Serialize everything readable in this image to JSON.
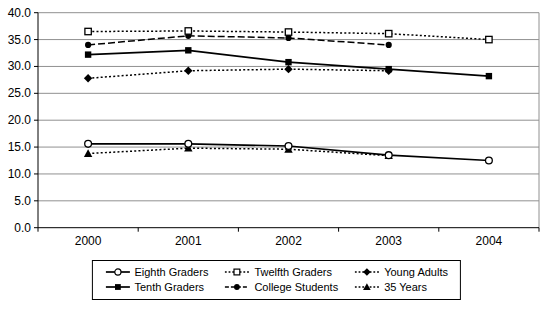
{
  "chart_data": {
    "type": "line",
    "title": "",
    "xlabel": "",
    "ylabel": "",
    "x_labels": [
      "2000",
      "2001",
      "2002",
      "2003",
      "2004"
    ],
    "ylim": [
      0,
      40
    ],
    "y_tick_step": 5,
    "y_tick_labels": [
      "0.0",
      "5.0",
      "10.0",
      "15.0",
      "20.0",
      "25.0",
      "30.0",
      "35.0",
      "40.0"
    ],
    "grid": true,
    "legend_position": "bottom",
    "series": [
      {
        "name": "Young Adults",
        "values": [
          27.8,
          29.2,
          29.5,
          29.2,
          null
        ],
        "line": "dotted",
        "marker": "filled-diamond"
      },
      {
        "name": "College Students",
        "values": [
          34.0,
          35.7,
          35.3,
          34.0,
          null
        ],
        "line": "dashed",
        "marker": "filled-circle"
      },
      {
        "name": "Twelfth Graders",
        "values": [
          36.5,
          36.6,
          36.4,
          36.1,
          35.0
        ],
        "line": "dotted",
        "marker": "open-square"
      },
      {
        "name": "Tenth Graders",
        "values": [
          32.2,
          33.0,
          30.8,
          29.5,
          28.2
        ],
        "line": "solid",
        "marker": "filled-square"
      },
      {
        "name": "35 Years",
        "values": [
          13.8,
          14.8,
          14.6,
          13.4,
          null
        ],
        "line": "dotted",
        "marker": "filled-triangle"
      },
      {
        "name": "Eighth Graders",
        "values": [
          15.6,
          15.6,
          15.2,
          13.5,
          12.5
        ],
        "line": "solid",
        "marker": "open-circle"
      }
    ],
    "legend_order": [
      "Eighth Graders",
      "Twelfth Graders",
      "Young Adults",
      "Tenth Graders",
      "College Students",
      "35 Years"
    ],
    "colors": {
      "line": "#000000",
      "grid": "#909090",
      "axis": "#000000",
      "background": "#ffffff"
    }
  }
}
